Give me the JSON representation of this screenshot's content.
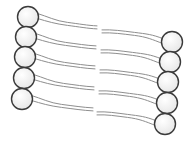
{
  "diagram": {
    "leaflets": [
      {
        "name": "left-leaflet",
        "molecule_count": 5,
        "head_orientation": "left",
        "tails_per_molecule": 2
      },
      {
        "name": "right-leaflet",
        "molecule_count": 5,
        "head_orientation": "right",
        "tails_per_molecule": 2
      }
    ],
    "colors": {
      "head_fill": "#f2f2f2",
      "head_stroke": "#3a3a3a",
      "tail_stroke": "#8e8e8e",
      "background": "#ffffff"
    }
  }
}
